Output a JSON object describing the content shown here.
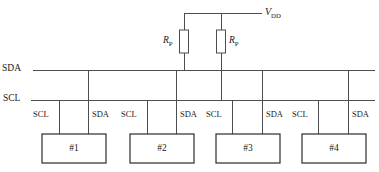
{
  "diagram": {
    "supply": {
      "symbol": "V",
      "subscript": "DD"
    },
    "bus_lines": [
      {
        "name": "sda",
        "label": "SDA"
      },
      {
        "name": "scl",
        "label": "SCL"
      }
    ],
    "pullup_resistors": [
      {
        "name": "rp-sda",
        "symbol": "R",
        "subscript": "P",
        "label_side": "left"
      },
      {
        "name": "rp-scl",
        "symbol": "R",
        "subscript": "P",
        "label_side": "right"
      }
    ],
    "devices": [
      {
        "label": "#1",
        "pins": {
          "left": "SCL",
          "right": "SDA"
        }
      },
      {
        "label": "#2",
        "pins": {
          "left": "SCL",
          "right": "SDA"
        }
      },
      {
        "label": "#3",
        "pins": {
          "left": "SCL",
          "right": "SDA"
        }
      },
      {
        "label": "#4",
        "pins": {
          "left": "SCL",
          "right": "SDA"
        }
      }
    ],
    "colors": {
      "wire": "#4d4d4d",
      "device_outline": "#2b2b2b",
      "text": "#1a1a1a",
      "background": "#ffffff"
    }
  }
}
